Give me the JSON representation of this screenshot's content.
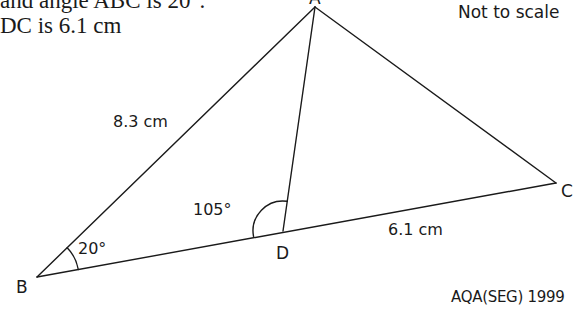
{
  "question": {
    "line1": "and angle ABC is 20°.",
    "line2": "DC is 6.1 cm"
  },
  "diagram": {
    "note": "Not to scale",
    "vertices": {
      "A": {
        "label": "A",
        "x": 315,
        "y": 7
      },
      "B": {
        "label": "B",
        "x": 37,
        "y": 277
      },
      "C": {
        "label": "C",
        "x": 556,
        "y": 183
      },
      "D": {
        "label": "D",
        "x": 283,
        "y": 231
      }
    },
    "edges": [
      "AB",
      "AC",
      "BC",
      "AD"
    ],
    "lengths": {
      "AB": "8.3 cm",
      "DC": "6.1 cm"
    },
    "angles": {
      "ABC": "20°",
      "ADB": "105°"
    },
    "source": "AQA(SEG) 1999",
    "line_color": "#1a1a1a"
  }
}
